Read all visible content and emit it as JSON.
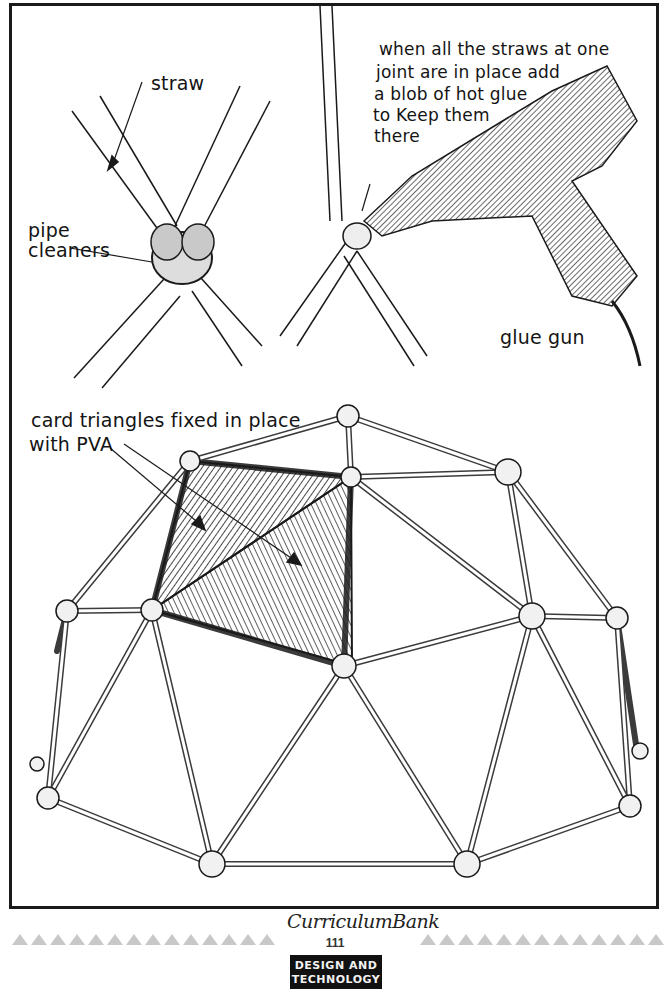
{
  "illustration": {
    "panel_top_left": {
      "labels": {
        "straw": "straw",
        "pipe_cleaners_line1": "pipe",
        "pipe_cleaners_line2": "cleaners"
      }
    },
    "panel_top_right": {
      "instruction_lines": [
        "when all the straws at one",
        "joint are in place add",
        "a blob of hot glue",
        "to Keep them",
        "there"
      ],
      "labels": {
        "glue_gun": "glue gun"
      }
    },
    "panel_bottom": {
      "caption_lines": [
        "card triangles fixed in place",
        "with PVA"
      ]
    }
  },
  "footer": {
    "logo_text": "CurriculumBank",
    "page_number": "111",
    "subject_tag_line1": "DESIGN AND",
    "subject_tag_line2": "TECHNOLOGY"
  },
  "colors": {
    "ink": "#141414",
    "frame_border": "#1a1a1a",
    "divider_triangles": "#c8c8c8",
    "tag_background": "#111111",
    "tag_text": "#f2f2f2",
    "page_background": "#ffffff"
  }
}
